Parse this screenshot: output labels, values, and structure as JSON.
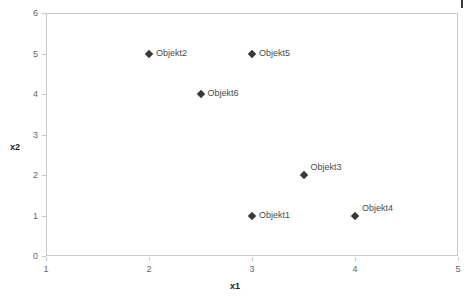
{
  "chart_data": {
    "type": "scatter",
    "title": "",
    "xlabel": "x1",
    "ylabel": "x2",
    "xlim": [
      1,
      5
    ],
    "ylim": [
      0,
      6
    ],
    "xticks": [
      1,
      2,
      3,
      4,
      5
    ],
    "yticks": [
      0,
      1,
      2,
      3,
      4,
      5,
      6
    ],
    "xtick_labels": [
      "1",
      "2",
      "3",
      "4",
      "5"
    ],
    "ytick_labels": [
      "0",
      "1",
      "2",
      "3",
      "4",
      "5",
      "6"
    ],
    "grid": false,
    "legend": "none",
    "marker": "diamond",
    "marker_color": "#3a3a3a",
    "frame_color": "#c9c9c9",
    "points": [
      {
        "label": "Objekt2",
        "x": 2,
        "y": 5,
        "label_position": "right"
      },
      {
        "label": "Objekt5",
        "x": 3,
        "y": 5,
        "label_position": "right"
      },
      {
        "label": "Objekt6",
        "x": 2.5,
        "y": 4,
        "label_position": "right"
      },
      {
        "label": "Objekt3",
        "x": 3.5,
        "y": 2,
        "label_position": "upper-right"
      },
      {
        "label": "Objekt1",
        "x": 3,
        "y": 1,
        "label_position": "right"
      },
      {
        "label": "Objekt4",
        "x": 4,
        "y": 1,
        "label_position": "upper-right"
      }
    ]
  },
  "axes": {
    "x_title": "x1",
    "y_title": "x2"
  }
}
